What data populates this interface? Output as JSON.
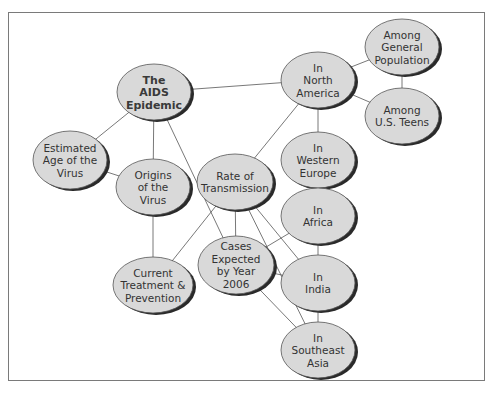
{
  "diagram": {
    "type": "concept-map",
    "nodes": [
      {
        "id": "aids",
        "label": [
          "The",
          "AIDS",
          "Epidemic"
        ],
        "bold": true,
        "cx": 154,
        "cy": 92,
        "rx": 37,
        "ry": 28
      },
      {
        "id": "age",
        "label": [
          "Estimated",
          "Age of the",
          "Virus"
        ],
        "bold": false,
        "cx": 70,
        "cy": 160,
        "rx": 37,
        "ry": 29
      },
      {
        "id": "origins",
        "label": [
          "Origins",
          "of the",
          "Virus"
        ],
        "bold": false,
        "cx": 153,
        "cy": 187,
        "rx": 37,
        "ry": 28
      },
      {
        "id": "treatment",
        "label": [
          "Current",
          "Treatment &",
          "Prevention"
        ],
        "bold": false,
        "cx": 153,
        "cy": 285,
        "rx": 40,
        "ry": 28
      },
      {
        "id": "rate",
        "label": [
          "Rate of",
          "Transmission"
        ],
        "bold": false,
        "cx": 235,
        "cy": 182,
        "rx": 38,
        "ry": 28
      },
      {
        "id": "cases",
        "label": [
          "Cases",
          "Expected",
          "by Year",
          "2006"
        ],
        "bold": false,
        "cx": 236,
        "cy": 265,
        "rx": 38,
        "ry": 29
      },
      {
        "id": "na",
        "label": [
          "In",
          "North",
          "America"
        ],
        "bold": false,
        "cx": 318,
        "cy": 80,
        "rx": 37,
        "ry": 28
      },
      {
        "id": "gen",
        "label": [
          "Among",
          "General",
          "Population"
        ],
        "bold": false,
        "cx": 402,
        "cy": 47,
        "rx": 37,
        "ry": 28
      },
      {
        "id": "teens",
        "label": [
          "Among",
          "U.S. Teens"
        ],
        "bold": false,
        "cx": 402,
        "cy": 116,
        "rx": 37,
        "ry": 28
      },
      {
        "id": "we",
        "label": [
          "In",
          "Western",
          "Europe"
        ],
        "bold": false,
        "cx": 318,
        "cy": 160,
        "rx": 37,
        "ry": 28
      },
      {
        "id": "africa",
        "label": [
          "In",
          "Africa"
        ],
        "bold": false,
        "cx": 318,
        "cy": 216,
        "rx": 37,
        "ry": 28
      },
      {
        "id": "india",
        "label": [
          "In",
          "India"
        ],
        "bold": false,
        "cx": 318,
        "cy": 283,
        "rx": 37,
        "ry": 28
      },
      {
        "id": "sea",
        "label": [
          "In",
          "Southeast",
          "Asia"
        ],
        "bold": false,
        "cx": 318,
        "cy": 350,
        "rx": 37,
        "ry": 28
      }
    ],
    "edges": [
      [
        "aids",
        "age"
      ],
      [
        "aids",
        "origins"
      ],
      [
        "aids",
        "na"
      ],
      [
        "aids",
        "cases"
      ],
      [
        "age",
        "origins"
      ],
      [
        "origins",
        "treatment"
      ],
      [
        "treatment",
        "rate"
      ],
      [
        "rate",
        "na"
      ],
      [
        "rate",
        "cases"
      ],
      [
        "rate",
        "india"
      ],
      [
        "rate",
        "sea"
      ],
      [
        "cases",
        "africa"
      ],
      [
        "cases",
        "india"
      ],
      [
        "cases",
        "sea"
      ],
      [
        "na",
        "gen"
      ],
      [
        "na",
        "teens"
      ],
      [
        "gen",
        "teens"
      ],
      [
        "na",
        "we"
      ],
      [
        "we",
        "africa"
      ],
      [
        "africa",
        "india"
      ],
      [
        "india",
        "sea"
      ]
    ],
    "style": {
      "node_fill": "#d9d9d9",
      "node_stroke": "#555555",
      "shadow": "#2a2a2a",
      "edge_color": "#555555",
      "text_color": "#333333",
      "bold_text_color": "#3a3a3a"
    }
  }
}
